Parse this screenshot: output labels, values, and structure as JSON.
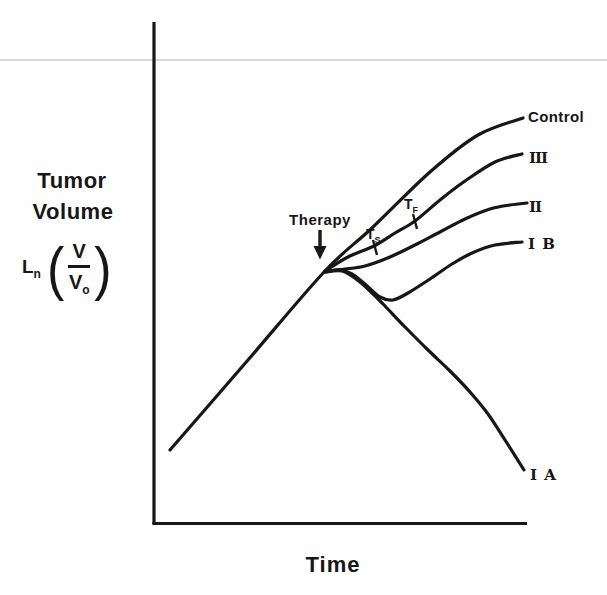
{
  "chart_data": {
    "type": "line",
    "title": "",
    "xlabel": "Time",
    "ylabel_lines": [
      "Tumor",
      "Volume"
    ],
    "formula": {
      "fn": "L",
      "fn_sub": "n",
      "numerator": "V",
      "denominator": "V",
      "denominator_sub": "o"
    },
    "annotations": {
      "therapy": "Therapy",
      "marker_s": {
        "base": "T",
        "sub": "S"
      },
      "marker_f": {
        "base": "T",
        "sub": "F"
      }
    },
    "axes": {
      "tick_labels": "none",
      "x_axis_px": {
        "y": 524,
        "from": 154,
        "to": 527
      },
      "y_axis_px": {
        "x": 154,
        "from": 22,
        "to": 524
      }
    },
    "ink_color": "#171717",
    "artifact_line_color": "#dadada",
    "series": [
      {
        "name": "Control",
        "points_px": [
          [
            170,
            450
          ],
          [
            248,
            360
          ],
          [
            325,
            271
          ],
          [
            372,
            228
          ],
          [
            430,
            172
          ],
          [
            478,
            135
          ],
          [
            523,
            118
          ]
        ]
      },
      {
        "name": "III",
        "points_px": [
          [
            325,
            271
          ],
          [
            348,
            257
          ],
          [
            374,
            246
          ],
          [
            395,
            233
          ],
          [
            415,
            221
          ],
          [
            440,
            200
          ],
          [
            465,
            181
          ],
          [
            495,
            162
          ],
          [
            522,
            154
          ]
        ]
      },
      {
        "name": "II",
        "points_px": [
          [
            325,
            271
          ],
          [
            345,
            269
          ],
          [
            365,
            266
          ],
          [
            390,
            257
          ],
          [
            415,
            245
          ],
          [
            440,
            232
          ],
          [
            465,
            219
          ],
          [
            490,
            209
          ],
          [
            510,
            205
          ],
          [
            527,
            203
          ]
        ]
      },
      {
        "name": "I B",
        "points_px": [
          [
            325,
            272
          ],
          [
            340,
            270
          ],
          [
            352,
            274
          ],
          [
            366,
            285
          ],
          [
            380,
            297
          ],
          [
            393,
            300
          ],
          [
            408,
            293
          ],
          [
            430,
            279
          ],
          [
            452,
            264
          ],
          [
            472,
            253
          ],
          [
            495,
            245
          ],
          [
            522,
            242
          ]
        ]
      },
      {
        "name": "I A",
        "points_px": [
          [
            325,
            272
          ],
          [
            342,
            271
          ],
          [
            356,
            279
          ],
          [
            370,
            291
          ],
          [
            385,
            306
          ],
          [
            405,
            327
          ],
          [
            428,
            350
          ],
          [
            450,
            371
          ],
          [
            470,
            392
          ],
          [
            488,
            414
          ],
          [
            505,
            440
          ],
          [
            524,
            470
          ]
        ]
      }
    ],
    "therapy_arrow_px": {
      "x": 320,
      "from_y": 230,
      "tip_y": 259
    },
    "marker_ticks_px": [
      {
        "marker": "TS",
        "x1": 373,
        "y1": 240,
        "x2": 377,
        "y2": 255
      },
      {
        "marker": "TF",
        "x1": 413,
        "y1": 214,
        "x2": 417,
        "y2": 229
      }
    ]
  }
}
